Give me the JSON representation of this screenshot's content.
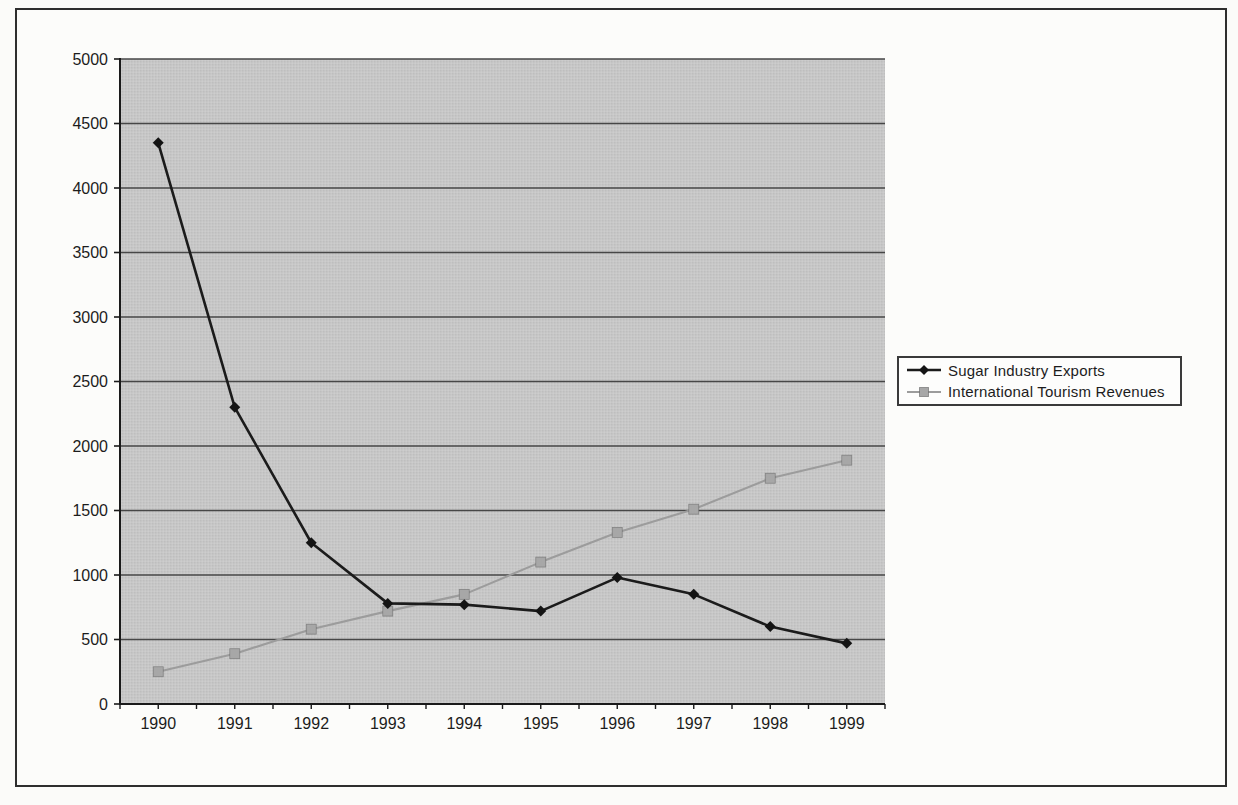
{
  "figure": {
    "background_color": "#fbfbf9",
    "frame_border_color": "#2e2e2e"
  },
  "chart_data": {
    "type": "line",
    "title": "",
    "xlabel": "",
    "ylabel": "",
    "categories": [
      "1990",
      "1991",
      "1992",
      "1993",
      "1994",
      "1995",
      "1996",
      "1997",
      "1998",
      "1999"
    ],
    "series": [
      {
        "name": "Sugar Industry Exports",
        "values": [
          4350,
          2300,
          1250,
          780,
          770,
          720,
          980,
          850,
          600,
          470
        ],
        "color": "#1b1b1b",
        "marker": "diamond",
        "marker_color": "#141414"
      },
      {
        "name": "International Tourism Revenues",
        "values": [
          250,
          390,
          580,
          720,
          850,
          1100,
          1330,
          1510,
          1750,
          1890
        ],
        "color": "#9c9c9c",
        "marker": "square",
        "marker_color": "#a7a7a7"
      }
    ],
    "ylim": [
      0,
      5000
    ],
    "ytick_step": 500,
    "yticks": [
      0,
      500,
      1000,
      1500,
      2000,
      2500,
      3000,
      3500,
      4000,
      4500,
      5000
    ],
    "grid": true,
    "legend_position": "right",
    "plot_bg_color": "#c7c7c7",
    "gridline_color": "#474747",
    "axis_color": "#1a1a1a",
    "tick_label_color": "#1c1c1c"
  }
}
